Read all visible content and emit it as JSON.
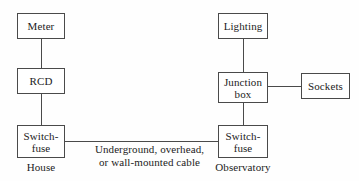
{
  "diagram": {
    "type": "block-diagram",
    "colors": {
      "background": "#fefefe",
      "stroke": "#4a4a4a",
      "text": "#1c1c1c"
    },
    "boxes": [
      {
        "id": "meter",
        "label": "Meter"
      },
      {
        "id": "rcd",
        "label": "RCD"
      },
      {
        "id": "switch-fuse-house",
        "label": "Switch-\nfuse"
      },
      {
        "id": "lighting",
        "label": "Lighting"
      },
      {
        "id": "junction-box",
        "label": "Junction\nbox"
      },
      {
        "id": "sockets",
        "label": "Sockets"
      },
      {
        "id": "switch-fuse-obs",
        "label": "Switch-\nfuse"
      }
    ],
    "captions": [
      {
        "id": "house",
        "label": "House"
      },
      {
        "id": "cable",
        "label": "Underground, overhead,\nor wall-mounted cable"
      },
      {
        "id": "observatory",
        "label": "Observatory"
      }
    ]
  }
}
